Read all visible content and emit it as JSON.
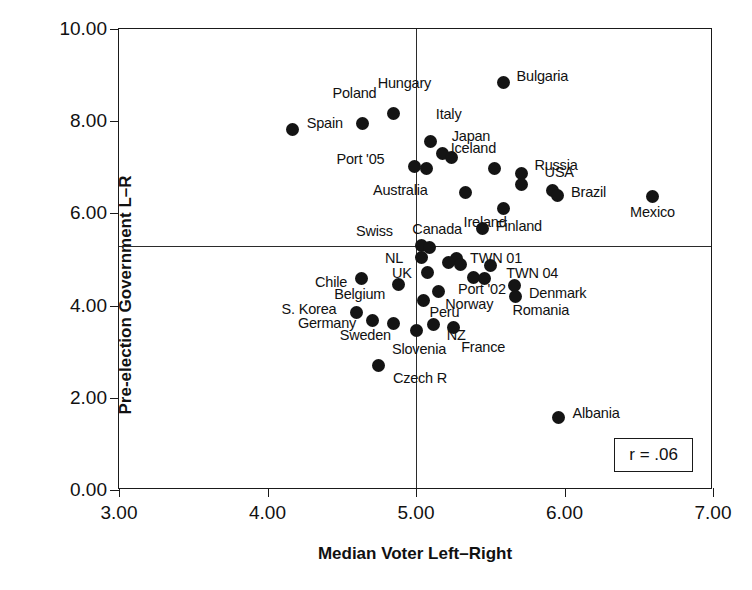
{
  "chart_data": {
    "type": "scatter",
    "title": "",
    "xlabel": "Median Voter Left–Right",
    "ylabel": "Pre-election Government L–R",
    "xlim": [
      3.0,
      7.0
    ],
    "ylim": [
      0.0,
      10.0
    ],
    "xticks": [
      "3.00",
      "4.00",
      "5.00",
      "6.00",
      "7.00"
    ],
    "xtick_values": [
      3.0,
      4.0,
      5.0,
      6.0,
      7.0
    ],
    "yticks": [
      "0.00",
      "2.00",
      "4.00",
      "6.00",
      "8.00",
      "10.00"
    ],
    "ytick_values": [
      0.0,
      2.0,
      4.0,
      6.0,
      8.0,
      10.0
    ],
    "grid": false,
    "legend": null,
    "annotation": "r = .06",
    "annotation_position": "bottom-right",
    "reference_lines": [
      {
        "orientation": "horizontal",
        "value": 5.29
      },
      {
        "orientation": "vertical",
        "value": 5.0
      }
    ],
    "points": [
      {
        "label": "Spain",
        "x": 4.17,
        "y": 7.83,
        "lx": 14,
        "ly": -6
      },
      {
        "label": "Poland",
        "x": 4.64,
        "y": 7.96,
        "lx": -30,
        "ly": -30
      },
      {
        "label": "Hungary",
        "x": 4.85,
        "y": 8.17,
        "lx": -16,
        "ly": -30
      },
      {
        "label": "Bulgaria",
        "x": 5.59,
        "y": 8.83,
        "lx": 13,
        "ly": -7
      },
      {
        "label": "Italy",
        "x": 5.1,
        "y": 7.55,
        "lx": 5,
        "ly": -28
      },
      {
        "label": "Japan",
        "x": 5.18,
        "y": 7.3,
        "lx": 9,
        "ly": -17
      },
      {
        "label": "",
        "x": 5.24,
        "y": 7.21,
        "lx": 0,
        "ly": 0
      },
      {
        "label": "Port '05",
        "x": 4.99,
        "y": 7.02,
        "lx": -78,
        "ly": -7
      },
      {
        "label": "",
        "x": 5.07,
        "y": 6.97,
        "lx": 0,
        "ly": 0
      },
      {
        "label": "Iceland",
        "x": 5.53,
        "y": 6.98,
        "lx": -44,
        "ly": -20
      },
      {
        "label": "Russia",
        "x": 5.71,
        "y": 6.86,
        "lx": 13,
        "ly": -9
      },
      {
        "label": "",
        "x": 5.71,
        "y": 6.62,
        "lx": 0,
        "ly": 0
      },
      {
        "label": "USA",
        "x": 5.92,
        "y": 6.49,
        "lx": -8,
        "ly": -19
      },
      {
        "label": "Brazil",
        "x": 5.95,
        "y": 6.38,
        "lx": 14,
        "ly": -4
      },
      {
        "label": "Mexico",
        "x": 6.59,
        "y": 6.36,
        "lx": -22,
        "ly": 15
      },
      {
        "label": "Australia",
        "x": 5.33,
        "y": 6.45,
        "lx": -92,
        "ly": -3
      },
      {
        "label": "Ireland",
        "x": 5.59,
        "y": 6.1,
        "lx": -40,
        "ly": 13
      },
      {
        "label": "Finland",
        "x": 5.45,
        "y": 5.68,
        "lx": 13,
        "ly": -2
      },
      {
        "label": "Swiss",
        "x": 5.04,
        "y": 5.3,
        "lx": -66,
        "ly": -15
      },
      {
        "label": "Canada",
        "x": 5.09,
        "y": 5.25,
        "lx": -17,
        "ly": -19
      },
      {
        "label": "NL",
        "x": 5.04,
        "y": 5.05,
        "lx": -37,
        "ly": 1
      },
      {
        "label": "TWN 01",
        "x": 5.27,
        "y": 5.03,
        "lx": 14,
        "ly": 0
      },
      {
        "label": "",
        "x": 5.22,
        "y": 4.93,
        "lx": 0,
        "ly": 0
      },
      {
        "label": "",
        "x": 5.3,
        "y": 4.9,
        "lx": 0,
        "ly": 0
      },
      {
        "label": "TWN 04",
        "x": 5.5,
        "y": 4.87,
        "lx": 16,
        "ly": 8
      },
      {
        "label": "UK",
        "x": 5.08,
        "y": 4.72,
        "lx": -36,
        "ly": 1
      },
      {
        "label": "Chile",
        "x": 4.63,
        "y": 4.58,
        "lx": -46,
        "ly": 3
      },
      {
        "label": "Belgium",
        "x": 4.88,
        "y": 4.46,
        "lx": -64,
        "ly": 10
      },
      {
        "label": "Port '02",
        "x": 5.39,
        "y": 4.6,
        "lx": -16,
        "ly": 11
      },
      {
        "label": "",
        "x": 5.46,
        "y": 4.58,
        "lx": 0,
        "ly": 0
      },
      {
        "label": "Denmark",
        "x": 5.66,
        "y": 4.44,
        "lx": 15,
        "ly": 8
      },
      {
        "label": "Romania",
        "x": 5.67,
        "y": 4.2,
        "lx": -3,
        "ly": 14
      },
      {
        "label": "Norway",
        "x": 5.15,
        "y": 4.3,
        "lx": 7,
        "ly": 12
      },
      {
        "label": "Peru",
        "x": 5.05,
        "y": 4.1,
        "lx": 6,
        "ly": 11
      },
      {
        "label": "S. Korea",
        "x": 4.6,
        "y": 3.86,
        "lx": -75,
        "ly": -3
      },
      {
        "label": "Germany",
        "x": 4.71,
        "y": 3.67,
        "lx": -75,
        "ly": 2
      },
      {
        "label": "Sweden",
        "x": 4.85,
        "y": 3.62,
        "lx": -54,
        "ly": 12
      },
      {
        "label": "NZ",
        "x": 5.12,
        "y": 3.58,
        "lx": 13,
        "ly": 10
      },
      {
        "label": "France",
        "x": 5.25,
        "y": 3.52,
        "lx": 8,
        "ly": 19
      },
      {
        "label": "Slovenia",
        "x": 5.0,
        "y": 3.46,
        "lx": -24,
        "ly": 19
      },
      {
        "label": "Czech R",
        "x": 4.75,
        "y": 2.7,
        "lx": 14,
        "ly": 12
      },
      {
        "label": "Albania",
        "x": 5.96,
        "y": 1.58,
        "lx": 14,
        "ly": -4
      }
    ]
  },
  "annotation_box": {
    "text": "r = .06"
  }
}
